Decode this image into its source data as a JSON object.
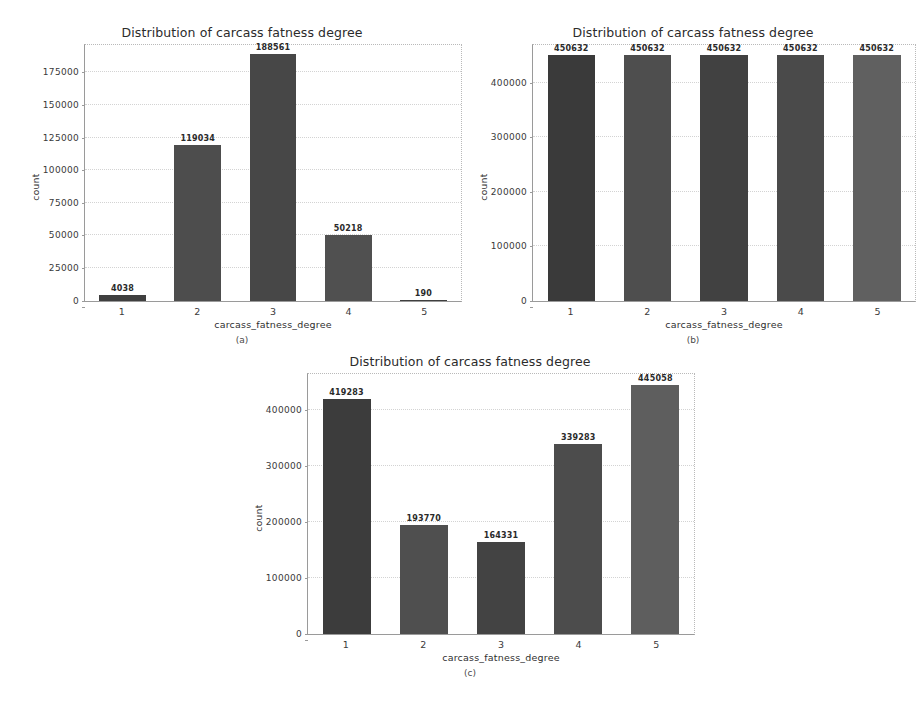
{
  "figures": [
    {
      "key": "a",
      "caption": "(a)",
      "chart_data": {
        "type": "bar",
        "title": "Distribution of carcass fatness degree",
        "xlabel": "carcass_fatness_degree",
        "ylabel": "count",
        "categories": [
          "1",
          "2",
          "3",
          "4",
          "5"
        ],
        "values": [
          4038,
          119034,
          188561,
          50218,
          190
        ],
        "value_labels": [
          "4038",
          "119034",
          "188561",
          "50218",
          "190"
        ],
        "yticks": [
          0,
          25000,
          50000,
          75000,
          100000,
          125000,
          150000,
          175000
        ],
        "ytick_labels": [
          "0",
          "25000",
          "50000",
          "75000",
          "100000",
          "125000",
          "150000",
          "175000"
        ],
        "ylim": [
          0,
          196000
        ],
        "grid": true,
        "legend": "none",
        "bar_colors": [
          "#3f3f3f",
          "#4d4d4d",
          "#474747",
          "#505050",
          "#3f3f3f"
        ]
      }
    },
    {
      "key": "b",
      "caption": "(b)",
      "chart_data": {
        "type": "bar",
        "title": "Distribution of carcass fatness degree",
        "xlabel": "carcass_fatness_degree",
        "ylabel": "count",
        "categories": [
          "1",
          "2",
          "3",
          "4",
          "5"
        ],
        "values": [
          450632,
          450632,
          450632,
          450632,
          450632
        ],
        "value_labels": [
          "450632",
          "450632",
          "450632",
          "450632",
          "450632"
        ],
        "yticks": [
          0,
          100000,
          200000,
          300000,
          400000
        ],
        "ytick_labels": [
          "0",
          "100000",
          "200000",
          "300000",
          "400000"
        ],
        "ylim": [
          0,
          470000
        ],
        "grid": true,
        "legend": "none",
        "bar_colors": [
          "#3a3a3a",
          "#4e4e4e",
          "#414141",
          "#4a4a4a",
          "#606060"
        ]
      }
    },
    {
      "key": "c",
      "caption": "(c)",
      "chart_data": {
        "type": "bar",
        "title": "Distribution of carcass fatness degree",
        "xlabel": "carcass_fatness_degree",
        "ylabel": "count",
        "categories": [
          "1",
          "2",
          "3",
          "4",
          "5"
        ],
        "values": [
          419283,
          193770,
          164331,
          339283,
          445058
        ],
        "value_labels": [
          "419283",
          "193770",
          "164331",
          "339283",
          "445058"
        ],
        "yticks": [
          0,
          100000,
          200000,
          300000,
          400000
        ],
        "ytick_labels": [
          "0",
          "100000",
          "200000",
          "300000",
          "400000"
        ],
        "ylim": [
          0,
          465000
        ],
        "grid": true,
        "legend": "none",
        "bar_colors": [
          "#3c3c3c",
          "#4f4f4f",
          "#434343",
          "#4c4c4c",
          "#5e5e5e"
        ]
      }
    }
  ]
}
